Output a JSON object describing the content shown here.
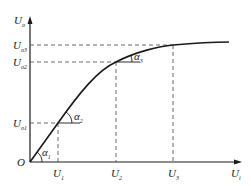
{
  "diagram": {
    "type": "input-output characteristic curve",
    "axes": {
      "y_label": "U",
      "y_sub": "o",
      "x_label": "U",
      "x_sub": "i",
      "origin_label": "O"
    },
    "y_ticks": [
      {
        "label": "U",
        "sub": "o1",
        "y": 123
      },
      {
        "label": "U",
        "sub": "o2",
        "y": 62
      },
      {
        "label": "U",
        "sub": "o3",
        "y": 45
      }
    ],
    "x_ticks": [
      {
        "label": "U",
        "sub": "1",
        "x": 58
      },
      {
        "label": "U",
        "sub": "2",
        "x": 116
      },
      {
        "label": "U",
        "sub": "3",
        "x": 173
      }
    ],
    "angles": [
      {
        "label": "α",
        "sub": "1"
      },
      {
        "label": "α",
        "sub": "2"
      },
      {
        "label": "α",
        "sub": "3"
      }
    ],
    "colors": {
      "line": "#1a1a1a",
      "dashed": "#444444",
      "background": "#ffffff"
    }
  }
}
